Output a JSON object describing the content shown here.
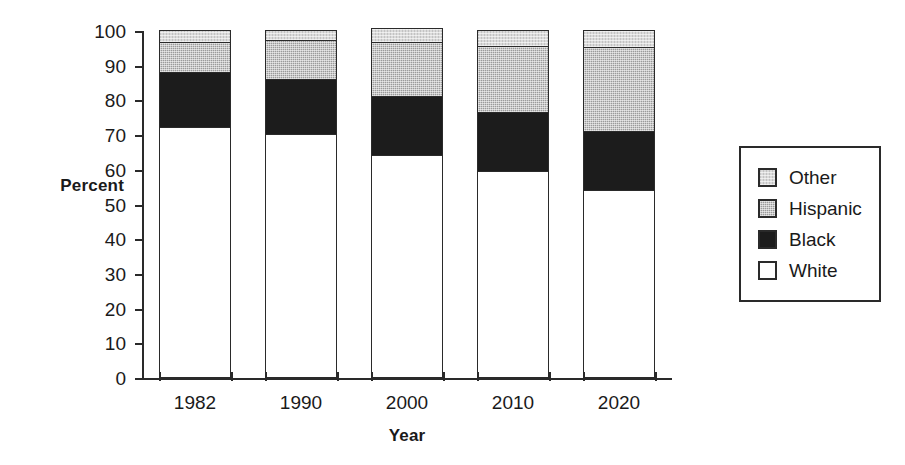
{
  "chart_data": {
    "type": "bar",
    "subtype": "stacked-bar-100",
    "title": "",
    "xlabel": "Year",
    "ylabel": "Percent",
    "categories": [
      "1982",
      "1990",
      "2000",
      "2010",
      "2020"
    ],
    "ylim": [
      0,
      100
    ],
    "yticks": [
      0,
      10,
      20,
      30,
      40,
      50,
      60,
      70,
      80,
      90,
      100
    ],
    "ytick_labels": [
      "0",
      "10",
      "20",
      "30",
      "40",
      "50",
      "60",
      "70",
      "80",
      "90",
      "100"
    ],
    "grid": false,
    "legend_position": "right",
    "series": [
      {
        "name": "White",
        "values": [
          72.0,
          70.0,
          64.0,
          59.5,
          54.0
        ],
        "color": "#ffffff",
        "swatch": "fill-white"
      },
      {
        "name": "Black",
        "values": [
          16.0,
          16.0,
          17.0,
          17.0,
          17.0
        ],
        "color": "#1c1c1c",
        "swatch": "fill-black"
      },
      {
        "name": "Hispanic",
        "values": [
          8.5,
          11.0,
          15.5,
          19.0,
          24.0
        ],
        "color": "#9a9a9a",
        "swatch": "fill-hispanic"
      },
      {
        "name": "Other",
        "values": [
          3.5,
          3.0,
          4.0,
          4.5,
          5.0
        ],
        "color": "#dadada",
        "swatch": "fill-other"
      }
    ],
    "legend_entries": [
      {
        "label": "Other",
        "swatch": "fill-other"
      },
      {
        "label": "Hispanic",
        "swatch": "fill-hispanic"
      },
      {
        "label": "Black",
        "swatch": "fill-black"
      },
      {
        "label": "White",
        "swatch": "fill-white"
      }
    ]
  }
}
